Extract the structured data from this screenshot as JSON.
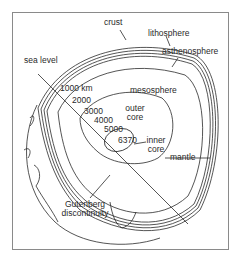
{
  "diagram": {
    "labels": {
      "crust": "crust",
      "lithosphere": "lithosphere",
      "asthenosphere": "asthenosphere",
      "sea_level": "sea level",
      "mesosphere": "mesosphere",
      "outer_core_line1": "outer",
      "outer_core_line2": "core",
      "inner_core_line1": "inner",
      "inner_core_line2": "core",
      "mantle": "mantle",
      "gutenberg_line1": "Gutenberg",
      "gutenberg_line2": "discontinuity"
    },
    "depths": [
      "1000 km",
      "2000",
      "3000",
      "4000",
      "5000",
      "6370"
    ],
    "colors": {
      "line": "#2a2a2a",
      "frame": "#8a8a8a",
      "background": "#ffffff"
    }
  }
}
